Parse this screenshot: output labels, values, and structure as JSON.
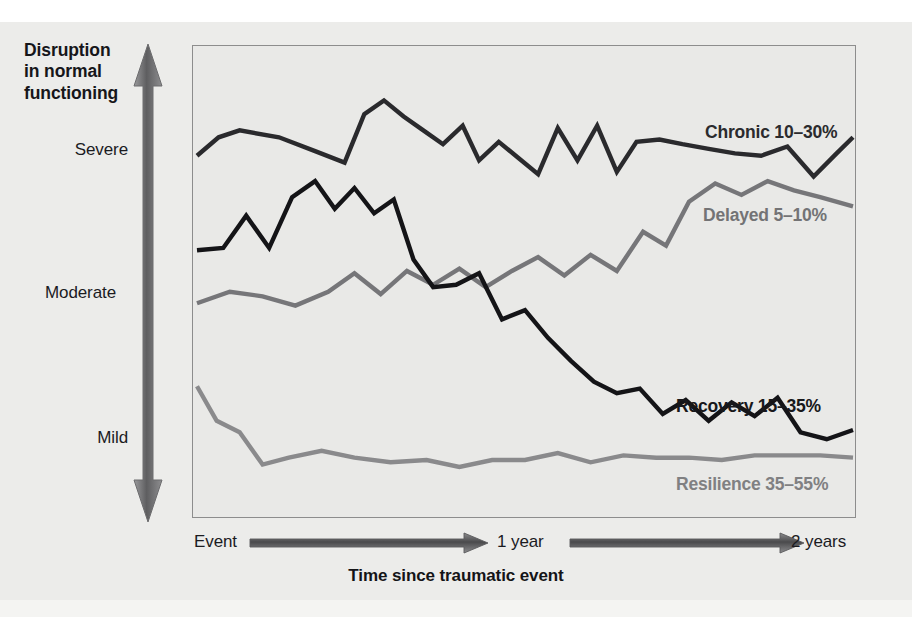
{
  "figure": {
    "background_color": "#ececea",
    "plot_background_color": "#e9e9e7",
    "plot_border_color": "#8d8d8d"
  },
  "yaxis": {
    "title": "Disruption in normal functioning",
    "title_line_1": "Disruption",
    "title_line_2": "in normal",
    "title_line_3": "functioning",
    "ticks": [
      "Severe",
      "Moderate",
      "Mild"
    ],
    "arrow_icon": "double-headed-vertical-arrow"
  },
  "xaxis": {
    "title": "Time since traumatic event",
    "ticks": [
      "Event",
      "1 year",
      "2 years"
    ],
    "arrow_icon": "right-arrow"
  },
  "series_labels": {
    "chronic": "Chronic 10–30%",
    "delayed": "Delayed 5–10%",
    "recovery": "Recovery 15–35%",
    "resilience": "Resilience 35–55%"
  },
  "colors": {
    "dark_line": "#2a2a2d",
    "black_line": "#141417",
    "gray_line": "#767679",
    "light_gray_line": "#8a8a8c"
  },
  "chart_data": {
    "type": "line",
    "xlabel": "Time since traumatic event",
    "ylabel": "Disruption in normal functioning",
    "grid": false,
    "legend": "inline-labels-at-right",
    "xlim": [
      0,
      100
    ],
    "ylim": [
      0,
      100
    ],
    "x_tick_positions": [
      0,
      50,
      100
    ],
    "x_tick_labels": [
      "Event",
      "1 year",
      "2 years"
    ],
    "y_tick_positions": [
      78,
      49,
      20
    ],
    "y_tick_labels": [
      "Severe",
      "Moderate",
      "Mild"
    ],
    "y_axis_direction": "Mild (low) at bottom to Severe (high) at top",
    "note": "y values are percent of plot height, 0 = bottom (least disruption), 100 = top (most disruption)",
    "series": [
      {
        "name": "Chronic 10–30%",
        "color": "#2a2a2d",
        "label": "Chronic 10–30%",
        "x": [
          0,
          3.3,
          6.5,
          12.5,
          18.0,
          22.5,
          25.5,
          28.5,
          31.5,
          34.5,
          37.5,
          40.5,
          43.0,
          46.0,
          49.0,
          52.0,
          55.0,
          58.0,
          61.0,
          64.0,
          67.0,
          70.5,
          74.0,
          78.0,
          82.0,
          86.0,
          90.0,
          94.0,
          97.5,
          100
        ],
        "y": [
          77.5,
          81.5,
          83.0,
          81.5,
          78.5,
          76.0,
          86.5,
          89.5,
          86.0,
          83.0,
          80.0,
          84.0,
          76.5,
          80.5,
          77.0,
          73.5,
          83.5,
          76.5,
          84.0,
          74.0,
          80.5,
          81.0,
          80.0,
          79.0,
          78.0,
          77.5,
          79.5,
          73.0,
          78.0,
          81.5
        ]
      },
      {
        "name": "Delayed 5–10%",
        "color": "#767679",
        "label": "Delayed 5–10%",
        "x": [
          0,
          5.0,
          10.0,
          15.0,
          20.0,
          24.0,
          28.0,
          32.0,
          36.0,
          40.0,
          44.0,
          48.0,
          52.0,
          56.0,
          60.0,
          64.0,
          68.0,
          71.5,
          75.0,
          79.0,
          83.0,
          87.0,
          91.0,
          95.0,
          100
        ],
        "y": [
          45.5,
          48.0,
          47.0,
          45.0,
          48.0,
          52.0,
          47.5,
          52.5,
          49.5,
          53.0,
          49.0,
          52.5,
          55.5,
          51.5,
          56.0,
          52.5,
          61.0,
          58.0,
          67.5,
          71.5,
          69.0,
          72.0,
          70.0,
          68.5,
          66.5
        ]
      },
      {
        "name": "Recovery 15–35%",
        "color": "#141417",
        "label": "Recovery 15–35%",
        "x": [
          0,
          4.0,
          7.5,
          11.0,
          14.5,
          18.0,
          21.0,
          24.0,
          27.0,
          30.0,
          33.0,
          36.0,
          39.5,
          43.0,
          46.5,
          50.0,
          53.5,
          57.0,
          60.5,
          64.0,
          67.5,
          71.0,
          74.5,
          78.0,
          81.5,
          85.0,
          88.5,
          92.0,
          96.0,
          100
        ],
        "y": [
          57.0,
          57.5,
          64.5,
          57.5,
          68.5,
          72.0,
          66.0,
          70.5,
          65.0,
          68.0,
          55.0,
          49.0,
          49.5,
          52.0,
          42.0,
          44.0,
          38.0,
          33.0,
          28.5,
          26.0,
          27.0,
          21.5,
          24.5,
          20.0,
          24.0,
          21.0,
          25.0,
          17.5,
          16.0,
          18.0
        ]
      },
      {
        "name": "Resilience 35–55%",
        "color": "#8a8a8c",
        "label": "Resilience 35–55%",
        "x": [
          0,
          3.0,
          6.5,
          10.0,
          14.0,
          19.0,
          24.0,
          29.5,
          35.0,
          40.0,
          45.0,
          50.0,
          55.0,
          60.0,
          65.0,
          70.0,
          75.0,
          80.0,
          85.0,
          90.0,
          95.0,
          100
        ],
        "y": [
          27.5,
          20.0,
          17.5,
          10.5,
          12.0,
          13.5,
          12.0,
          11.0,
          11.5,
          10.0,
          11.5,
          11.5,
          13.0,
          11.0,
          12.5,
          12.0,
          12.0,
          11.5,
          12.5,
          12.5,
          12.5,
          12.0
        ]
      }
    ]
  }
}
